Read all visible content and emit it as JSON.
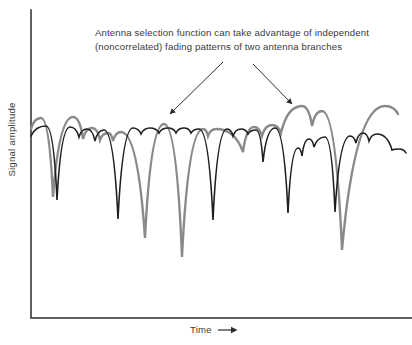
{
  "figure": {
    "annotation": {
      "line1": "Antenna selection function can take advantage of independent",
      "line2": "(noncorrelated) fading patterns of two antenna branches"
    },
    "y_axis_label": "Signal amplitude",
    "x_axis_label": "Time",
    "colors": {
      "branch1": "#1f1f1f",
      "branch2": "#8a8a8a",
      "axis": "#2b2b2b",
      "text": "#3a3a3a",
      "arrow": "#2b2b2b"
    }
  },
  "chart_data": {
    "type": "line",
    "title": "",
    "xlabel": "Time",
    "ylabel": "Signal amplitude",
    "annotation": "Antenna selection function can take advantage of independent (noncorrelated) fading patterns of two antenna branches",
    "axis_ticks": "none",
    "grid": false,
    "legend": "none",
    "coordinate_space": "pixels of 412x345 canvas, y increases downward; curves depict signal amplitude fading vs time",
    "axis_px": {
      "y_axis": [
        [
          31,
          10
        ],
        [
          31,
          318
        ]
      ],
      "x_axis": [
        [
          31,
          318
        ],
        [
          412,
          318
        ]
      ]
    },
    "series": [
      {
        "name": "antenna-branch-1-fading",
        "color": "#1f1f1f",
        "stroke_width": 1.6,
        "points_px": [
          [
            31,
            136
          ],
          [
            46,
            126
          ],
          [
            57,
            200
          ],
          [
            70,
            127
          ],
          [
            79,
            137
          ],
          [
            87,
            129
          ],
          [
            95,
            141
          ],
          [
            104,
            130
          ],
          [
            118,
            219
          ],
          [
            133,
            128
          ],
          [
            141,
            134
          ],
          [
            150,
            128
          ],
          [
            159,
            133
          ],
          [
            168,
            128
          ],
          [
            176,
            133
          ],
          [
            184,
            128
          ],
          [
            191,
            133
          ],
          [
            199,
            129
          ],
          [
            213,
            220
          ],
          [
            227,
            129
          ],
          [
            233,
            136
          ],
          [
            241,
            129
          ],
          [
            248,
            134
          ],
          [
            256,
            130
          ],
          [
            263,
            162
          ],
          [
            275,
            128
          ],
          [
            288,
            213
          ],
          [
            298,
            148
          ],
          [
            302,
            156
          ],
          [
            309,
            139
          ],
          [
            314,
            147
          ],
          [
            325,
            137
          ],
          [
            335,
            212
          ],
          [
            350,
            136
          ],
          [
            356,
            143
          ],
          [
            363,
            133
          ],
          [
            369,
            141
          ],
          [
            377,
            134
          ],
          [
            392,
            150
          ],
          [
            399,
            149
          ],
          [
            406,
            153
          ]
        ]
      },
      {
        "name": "antenna-branch-2-fading",
        "color": "#8a8a8a",
        "stroke_width": 2.4,
        "points_px": [
          [
            31,
            129
          ],
          [
            41,
            118
          ],
          [
            53,
            197
          ],
          [
            73,
            117
          ],
          [
            83,
            139
          ],
          [
            92,
            128
          ],
          [
            100,
            140
          ],
          [
            108,
            133
          ],
          [
            113,
            141
          ],
          [
            121,
            132
          ],
          [
            145,
            238
          ],
          [
            164,
            124
          ],
          [
            182,
            257
          ],
          [
            203,
            129
          ],
          [
            208,
            136
          ],
          [
            216,
            129
          ],
          [
            243,
            152
          ],
          [
            254,
            127
          ],
          [
            262,
            136
          ],
          [
            272,
            125
          ],
          [
            281,
            133
          ],
          [
            302,
            106
          ],
          [
            312,
            126
          ],
          [
            322,
            111
          ],
          [
            342,
            250
          ],
          [
            385,
            106
          ],
          [
            398,
            114
          ]
        ]
      }
    ],
    "annotation_arrows": [
      {
        "from": [
          223,
          62
        ],
        "to": [
          170,
          114
        ]
      },
      {
        "from": [
          253,
          64
        ],
        "to": [
          292,
          104
        ]
      }
    ]
  }
}
